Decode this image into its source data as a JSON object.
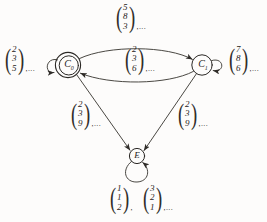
{
  "figure": {
    "type": "state-transition-diagram",
    "background_color": "#fdfcfb",
    "ink_color": "#2a2724"
  },
  "nodes": [
    {
      "id": "C0",
      "label": "C",
      "subscript": "0",
      "shape": "double-circle",
      "x": 68,
      "y": 65
    },
    {
      "id": "C1",
      "label": "C",
      "subscript": "1",
      "shape": "circle",
      "x": 202,
      "y": 65
    },
    {
      "id": "E",
      "label": "E",
      "subscript": "",
      "shape": "circle",
      "x": 137,
      "y": 156
    }
  ],
  "labels": {
    "top": {
      "vector": [
        "5",
        "8",
        "3"
      ],
      "suffix": ",...",
      "x": 114,
      "y": 2
    },
    "left": {
      "vector": [
        "2",
        "3",
        "5"
      ],
      "suffix": ",...",
      "x": 3,
      "y": 44
    },
    "middle": {
      "vector": [
        "2",
        "3",
        "6"
      ],
      "suffix": ",...",
      "x": 123,
      "y": 44
    },
    "right": {
      "vector": [
        "7",
        "8",
        "6"
      ],
      "suffix": ",...",
      "x": 227,
      "y": 44
    },
    "lower_left": {
      "vector": [
        "2",
        "3",
        "9"
      ],
      "suffix": ",...",
      "x": 69,
      "y": 99
    },
    "lower_right": {
      "vector": [
        "2",
        "3",
        "9"
      ],
      "suffix": ",...",
      "x": 176,
      "y": 99
    },
    "bottom_first": {
      "vector": [
        "1",
        "1",
        "2"
      ],
      "suffix": ",",
      "x": 108,
      "y": 183
    },
    "bottom_second": {
      "vector": [
        "3",
        "2",
        "1"
      ],
      "suffix": ",...",
      "x": 141,
      "y": 183
    }
  },
  "edges": [
    {
      "from": "C0",
      "to": "C1",
      "kind": "curve-top",
      "label_ref": "top"
    },
    {
      "from": "C1",
      "to": "C0",
      "kind": "curve-bottom",
      "label_ref": "middle"
    },
    {
      "from": "C0",
      "to": "E",
      "kind": "straight",
      "label_ref": "lower_left"
    },
    {
      "from": "C1",
      "to": "E",
      "kind": "straight",
      "label_ref": "lower_right"
    },
    {
      "from": "C0",
      "to": "C0",
      "kind": "self-loop-left",
      "label_ref": "left"
    },
    {
      "from": "C1",
      "to": "C1",
      "kind": "self-loop-right",
      "label_ref": "right"
    },
    {
      "from": "E",
      "to": "E",
      "kind": "self-loop-bottom",
      "label_ref": "bottom_first"
    }
  ]
}
